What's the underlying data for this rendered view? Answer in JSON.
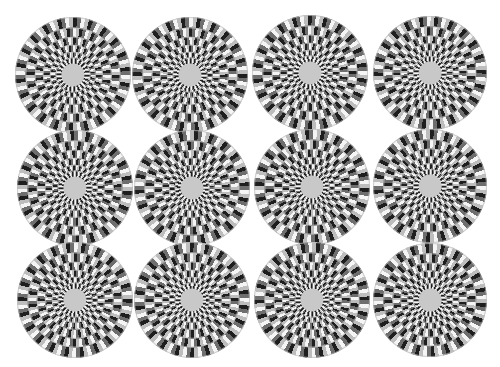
{
  "image": {
    "description": "Grid of rotating-snakes optical illusion discs",
    "background": "#ffffff",
    "rows": 3,
    "columns": 4,
    "colors": {
      "black": "#1e1e1e",
      "dark_gray": "#6e6e6e",
      "white": "#f5f5f5",
      "light_gray": "#bdbdbd"
    },
    "discs": [
      {
        "cx": 73,
        "cy": 75,
        "r": 58
      },
      {
        "cx": 190,
        "cy": 75,
        "r": 58
      },
      {
        "cx": 310,
        "cy": 73,
        "r": 58
      },
      {
        "cx": 430,
        "cy": 73,
        "r": 57
      },
      {
        "cx": 75,
        "cy": 188,
        "r": 58
      },
      {
        "cx": 192,
        "cy": 188,
        "r": 58
      },
      {
        "cx": 312,
        "cy": 187,
        "r": 58
      },
      {
        "cx": 430,
        "cy": 186,
        "r": 57
      },
      {
        "cx": 75,
        "cy": 300,
        "r": 58
      },
      {
        "cx": 192,
        "cy": 300,
        "r": 58
      },
      {
        "cx": 312,
        "cy": 300,
        "r": 58
      },
      {
        "cx": 430,
        "cy": 300,
        "r": 57
      }
    ]
  }
}
